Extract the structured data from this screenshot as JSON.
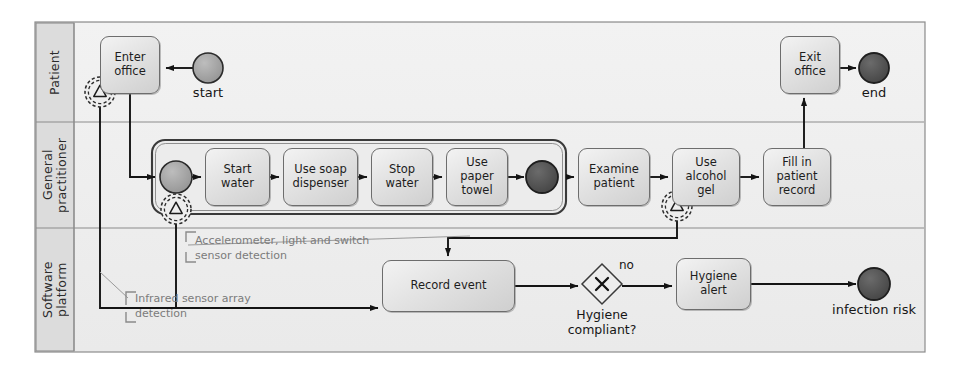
{
  "diagram": {
    "notation": "bpmn",
    "frame": {
      "x": 35,
      "y": 22,
      "w": 890,
      "h": 330
    }
  },
  "colors": {
    "frame_fill": "#e9e9e9",
    "lane_header_fill": "#d8d8d8",
    "lane_fill": "#f0f0f0",
    "task_fill": "#e2e2e2",
    "task_stroke": "#6d6d6d",
    "start_event_fill": "#9a9a9a",
    "end_event_fill": "#4a4a4a",
    "line": "#141414",
    "annotation_text": "#7b7b7b"
  },
  "lanes": [
    {
      "id": "patient",
      "label": "Patient"
    },
    {
      "id": "general-practitioner",
      "label": "General\npractitioner"
    },
    {
      "id": "software-platform",
      "label": "Software\nplatform"
    }
  ],
  "tasks": [
    {
      "id": "enter-office",
      "label": "Enter office",
      "lane": "patient",
      "x": 100,
      "y": 36,
      "w": 60,
      "h": 58
    },
    {
      "id": "exit-office",
      "label": "Exit office",
      "lane": "patient",
      "x": 780,
      "y": 36,
      "w": 60,
      "h": 58
    },
    {
      "id": "start-water",
      "label": "Start water",
      "lane": "general-practitioner",
      "x": 205,
      "y": 148,
      "w": 65,
      "h": 58
    },
    {
      "id": "use-soap-dispenser",
      "label": "Use soap dispenser",
      "lane": "general-practitioner",
      "x": 283,
      "y": 148,
      "w": 75,
      "h": 58
    },
    {
      "id": "stop-water",
      "label": "Stop water",
      "lane": "general-practitioner",
      "x": 371,
      "y": 148,
      "w": 62,
      "h": 58
    },
    {
      "id": "use-paper-towel",
      "label": "Use paper towel",
      "lane": "general-practitioner",
      "x": 446,
      "y": 148,
      "w": 62,
      "h": 58
    },
    {
      "id": "examine-patient",
      "label": "Examine patient",
      "lane": "general-practitioner",
      "x": 578,
      "y": 148,
      "w": 72,
      "h": 58
    },
    {
      "id": "use-alcohol-gel",
      "label": "Use alcohol gel",
      "lane": "general-practitioner",
      "x": 672,
      "y": 148,
      "w": 68,
      "h": 58
    },
    {
      "id": "fill-in-patient-record",
      "label": "Fill in patient record",
      "lane": "general-practitioner",
      "x": 763,
      "y": 148,
      "w": 68,
      "h": 58
    },
    {
      "id": "record-event",
      "label": "Record event",
      "lane": "software-platform",
      "x": 382,
      "y": 260,
      "w": 133,
      "h": 52,
      "marker": "data-store-icon"
    },
    {
      "id": "hygiene-alert",
      "label": "Hygiene alert",
      "lane": "software-platform",
      "x": 676,
      "y": 258,
      "w": 75,
      "h": 52
    }
  ],
  "events": [
    {
      "id": "start-event",
      "label": "start",
      "type": "start",
      "cx": 208,
      "cy": 68,
      "r": 15
    },
    {
      "id": "end-event",
      "label": "end",
      "type": "end",
      "cx": 874,
      "cy": 68,
      "r": 15
    },
    {
      "id": "subprocess-start-event",
      "label": "",
      "type": "start",
      "cx": 176,
      "cy": 177,
      "r": 16
    },
    {
      "id": "subprocess-end-event",
      "label": "",
      "type": "end",
      "cx": 542,
      "cy": 177,
      "r": 16
    },
    {
      "id": "infection-risk-event",
      "label": "infection risk",
      "type": "end",
      "cx": 874,
      "cy": 284,
      "r": 16
    }
  ],
  "boundary_events": [
    {
      "id": "boundary-enter-office",
      "attached_to": "enter-office",
      "symbol": "signal-triangle-icon",
      "cx": 100,
      "cy": 92,
      "r": 15
    },
    {
      "id": "boundary-subprocess",
      "attached_to": "hand-hygiene-subprocess",
      "symbol": "signal-triangle-icon",
      "cx": 176,
      "cy": 209,
      "r": 15
    },
    {
      "id": "boundary-use-alcohol-gel",
      "attached_to": "use-alcohol-gel",
      "symbol": "signal-triangle-icon",
      "cx": 677,
      "cy": 206,
      "r": 15
    }
  ],
  "gateways": [
    {
      "id": "hygiene-compliant-gateway",
      "type": "exclusive",
      "symbol": "X",
      "label": "Hygiene compliant?",
      "cx": 602,
      "cy": 284,
      "r": 20
    }
  ],
  "flow_labels": [
    {
      "id": "flow-label-no",
      "text": "no",
      "x": 619,
      "y": 258
    }
  ],
  "annotations": [
    {
      "id": "annotation-accelerometer",
      "text": "Accelerometer, light and switch sensor detection",
      "x": 187,
      "y": 234,
      "w": 175
    },
    {
      "id": "annotation-infrared",
      "text": "Infrared sensor array detection",
      "x": 126,
      "y": 292,
      "w": 150
    }
  ],
  "subprocess": {
    "id": "hand-hygiene-subprocess",
    "label": "",
    "x": 152,
    "y": 140,
    "w": 414,
    "h": 74
  }
}
